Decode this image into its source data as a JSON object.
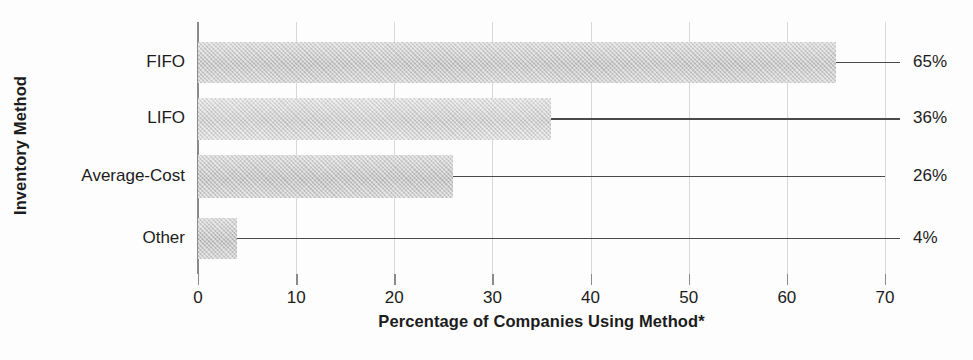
{
  "chart_data": {
    "type": "bar",
    "orientation": "horizontal",
    "title": "",
    "xlabel": "Percentage of Companies Using Method*",
    "ylabel": "Inventory Method",
    "categories": [
      "FIFO",
      "LIFO",
      "Average-Cost",
      "Other"
    ],
    "values": [
      65,
      36,
      26,
      4
    ],
    "data_labels": [
      "65%",
      "36%",
      "26%",
      "4%"
    ],
    "xlim": [
      0,
      70
    ],
    "xticks": [
      0,
      10,
      20,
      30,
      40,
      50,
      60,
      70
    ],
    "xtick_labels": [
      "0",
      "10",
      "20",
      "30",
      "40",
      "50",
      "60",
      "70"
    ],
    "grid": "vertical-only",
    "legend": "none",
    "bar_colors": [
      "#c9c9c9",
      "#d4d4d4",
      "#c7c7c7",
      "#c4c4c4"
    ],
    "axis_color": "#8a8a8a",
    "gridline_color": "#d8d8d8",
    "leader_line_color": "#4a4a4a",
    "text_color": "#1c1c1c",
    "background": "#fdfdfd",
    "footnote_marker": "*"
  },
  "axes": {
    "y_title": "Inventory Method",
    "x_title": "Percentage of Companies Using Method*"
  }
}
